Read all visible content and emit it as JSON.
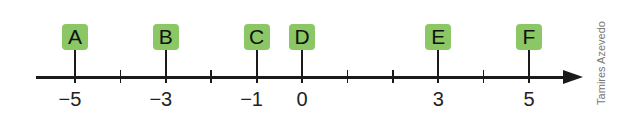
{
  "diagram": {
    "type": "number-line",
    "axis": {
      "min": -6,
      "max": 6,
      "tick_step": 1,
      "arrow_direction": "right",
      "color": "#1a1a1a"
    },
    "ticks": [
      -5,
      -4,
      -3,
      -2,
      -1,
      0,
      1,
      2,
      3,
      4,
      5
    ],
    "tick_labels": [
      {
        "value": -5,
        "text": "−5"
      },
      {
        "value": -3,
        "text": "−3"
      },
      {
        "value": -1,
        "text": "−1"
      },
      {
        "value": 0,
        "text": "0"
      },
      {
        "value": 3,
        "text": "3"
      },
      {
        "value": 5,
        "text": "5"
      }
    ],
    "points": [
      {
        "label": "A",
        "value": -5
      },
      {
        "label": "B",
        "value": -3
      },
      {
        "label": "C",
        "value": -1
      },
      {
        "label": "D",
        "value": 0
      },
      {
        "label": "E",
        "value": 3
      },
      {
        "label": "F",
        "value": 5
      }
    ],
    "point_box_color": "#8bc765",
    "credit": "Tamires Azevedo"
  }
}
